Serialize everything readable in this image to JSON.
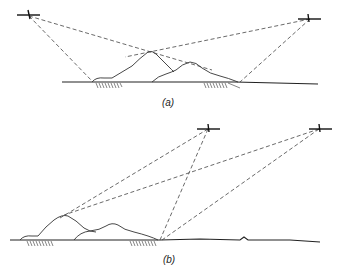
{
  "figure": {
    "panel_a": {
      "caption": "(a)",
      "description": "Two aircraft on opposite sides with sight lines to ground shadow zones beyond a pair of hills"
    },
    "panel_b": {
      "caption": "(b)",
      "description": "Two aircraft on the right side with sight lines crossing to shadowed ground areas behind hills on the left"
    }
  }
}
